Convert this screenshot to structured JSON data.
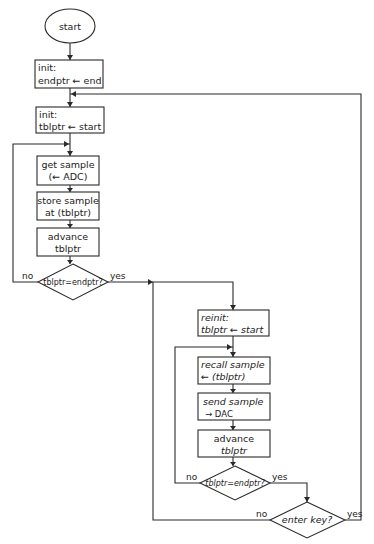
{
  "diagram": {
    "type": "flowchart",
    "style": "hand-drawn",
    "colors": {
      "ink": "#2a2a2a",
      "background": "#ffffff"
    },
    "nodes": {
      "start": {
        "shape": "oval",
        "label": "start"
      },
      "init_endptr": {
        "shape": "box",
        "line1": "init:",
        "line2": "endptr ← end"
      },
      "init_tblptr": {
        "shape": "box",
        "line1": "init:",
        "line2": "tblptr ← start"
      },
      "get_sample": {
        "shape": "box",
        "line1": "get sample",
        "line2": "(← ADC)"
      },
      "store_sample": {
        "shape": "box",
        "line1": "store sample",
        "line2": "at (tblptr)"
      },
      "advance_1": {
        "shape": "box",
        "line1": "advance",
        "line2": "tblptr"
      },
      "decision_1": {
        "shape": "diamond",
        "label": "tblptr=endptr?"
      },
      "reinit": {
        "shape": "box",
        "line1": "reinit:",
        "line2": "tblptr ← start"
      },
      "recall_sample": {
        "shape": "box",
        "line1": "recall sample",
        "line2": "← (tblptr)"
      },
      "send_sample": {
        "shape": "box",
        "line1": "send sample",
        "line2": "→ DAC"
      },
      "advance_2": {
        "shape": "box",
        "line1": "advance",
        "line2": "tblptr"
      },
      "decision_2": {
        "shape": "diamond",
        "label": "tblptr=endptr?"
      },
      "decision_3": {
        "shape": "diamond",
        "label": "enter key?"
      }
    },
    "edge_labels": {
      "d1_no": "no",
      "d1_yes": "yes",
      "d2_no": "no",
      "d2_yes": "yes",
      "d3_no": "no",
      "d3_yes": "yes"
    },
    "edges": [
      {
        "from": "start",
        "to": "init_endptr"
      },
      {
        "from": "init_endptr",
        "to": "init_tblptr"
      },
      {
        "from": "init_tblptr",
        "to": "get_sample"
      },
      {
        "from": "get_sample",
        "to": "store_sample"
      },
      {
        "from": "store_sample",
        "to": "advance_1"
      },
      {
        "from": "advance_1",
        "to": "decision_1"
      },
      {
        "from": "decision_1",
        "to": "get_sample",
        "label": "no"
      },
      {
        "from": "decision_1",
        "to": "reinit",
        "label": "yes"
      },
      {
        "from": "reinit",
        "to": "recall_sample"
      },
      {
        "from": "recall_sample",
        "to": "send_sample"
      },
      {
        "from": "send_sample",
        "to": "advance_2"
      },
      {
        "from": "advance_2",
        "to": "decision_2"
      },
      {
        "from": "decision_2",
        "to": "recall_sample",
        "label": "no"
      },
      {
        "from": "decision_2",
        "to": "decision_3",
        "label": "yes"
      },
      {
        "from": "decision_3",
        "to": "reinit",
        "label": "no"
      },
      {
        "from": "decision_3",
        "to": "init_tblptr",
        "label": "yes"
      }
    ]
  }
}
